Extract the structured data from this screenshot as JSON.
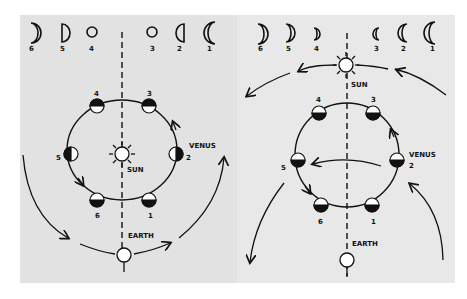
{
  "figure": {
    "left": {
      "phase_labels": [
        "6",
        "5",
        "4",
        "3",
        "2",
        "1"
      ],
      "orbit_position_labels": [
        "4",
        "3",
        "5",
        "2",
        "6",
        "1"
      ],
      "sun_label": "SUN",
      "venus_label": "VENUS",
      "earth_label": "EARTH"
    },
    "right": {
      "phase_labels": [
        "6",
        "5",
        "4",
        "3",
        "2",
        "1"
      ],
      "orbit_position_labels": [
        "4",
        "3",
        "5",
        "2",
        "6",
        "1"
      ],
      "sun_label": "SUN",
      "venus_label": "VENUS",
      "earth_label": "EARTH"
    }
  },
  "colors": {
    "panel_bg": "#e2e2e2",
    "ink": "#111111",
    "page_bg": "#ffffff"
  }
}
